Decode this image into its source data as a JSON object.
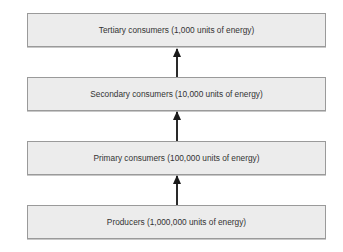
{
  "diagram": {
    "type": "energy-pyramid-flow",
    "levels": [
      {
        "label": "Tertiary consumers (1,000 units of energy)"
      },
      {
        "label": "Secondary consumers (10,000 units of energy)"
      },
      {
        "label": "Primary consumers (100,000 units of energy)"
      },
      {
        "label": "Producers (1,000,000 units of energy)"
      }
    ],
    "arrows": [
      {
        "from": "Producers",
        "to": "Primary consumers"
      },
      {
        "from": "Primary consumers",
        "to": "Secondary consumers"
      },
      {
        "from": "Secondary consumers",
        "to": "Tertiary consumers"
      }
    ],
    "colors": {
      "box_fill": "#ececec",
      "box_border": "#9a9a9a",
      "arrow": "#1a1a1a",
      "text": "#333333"
    }
  }
}
